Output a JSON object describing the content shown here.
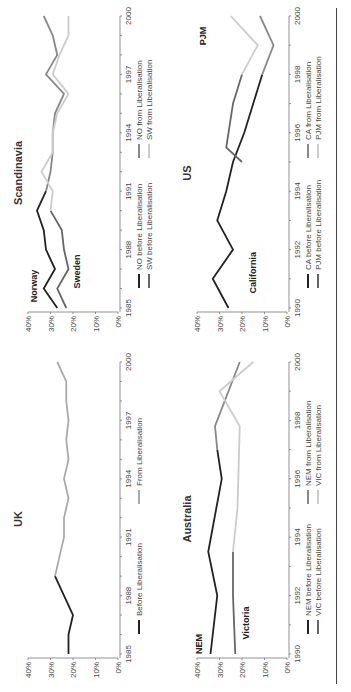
{
  "chart_data": [
    {
      "type": "line",
      "title": "UK",
      "x": [
        1985,
        1986,
        1987,
        1988,
        1989,
        1990,
        1991,
        1992,
        1993,
        1994,
        1995,
        1996,
        1997,
        1998,
        1999,
        2000
      ],
      "xticks": [
        "1985",
        "1988",
        "1991",
        "1994",
        "1997",
        "2000"
      ],
      "yticks": [
        "0%",
        "10%",
        "20%",
        "30%",
        "40%"
      ],
      "ylim": [
        0,
        40
      ],
      "series": [
        {
          "name": "Before Liberalisation",
          "color": "#222222",
          "x": [
            1985,
            1986,
            1987,
            1988,
            1989
          ],
          "values": [
            22,
            22,
            20,
            24,
            28
          ]
        },
        {
          "name": "From Liberalisation",
          "color": "#aaaaaa",
          "x": [
            1989,
            1990,
            1991,
            1992,
            1993,
            1994,
            1995,
            1996,
            1997,
            1998,
            1999,
            2000
          ],
          "values": [
            28,
            26,
            24,
            24,
            22,
            24,
            22,
            23,
            22,
            23,
            23,
            27
          ]
        }
      ],
      "legend": [
        "Before Liberalisation",
        "From Liberalisation"
      ]
    },
    {
      "type": "line",
      "title": "Scandinavia",
      "xticks": [
        "1985",
        "1988",
        "1991",
        "1994",
        "1997",
        "2000"
      ],
      "yticks": [
        "0%",
        "10%",
        "20%",
        "30%",
        "40%"
      ],
      "ylim": [
        0,
        40
      ],
      "annotations": [
        "Norway",
        "Sweden"
      ],
      "series": [
        {
          "name": "NO before Liberalisation",
          "color": "#222222",
          "x": [
            1985,
            1986,
            1987,
            1988,
            1989,
            1990,
            1991
          ],
          "values": [
            27,
            33,
            28,
            32,
            33,
            36,
            32
          ]
        },
        {
          "name": "SW before Liberalisation",
          "color": "#666666",
          "x": [
            1985,
            1986,
            1987,
            1988,
            1989,
            1990
          ],
          "values": [
            23,
            27,
            22,
            24,
            25,
            30
          ]
        },
        {
          "name": "NO from Liberalisation",
          "color": "#888888",
          "x": [
            1991,
            1992,
            1993,
            1994,
            1995,
            1996,
            1997,
            1998,
            1999,
            2000
          ],
          "values": [
            32,
            30,
            29,
            29,
            28,
            24,
            32,
            27,
            29,
            33
          ]
        },
        {
          "name": "SW from Liberalisation",
          "color": "#cccccc",
          "x": [
            1990,
            1991,
            1992,
            1993,
            1994,
            1995,
            1996,
            1997,
            1998,
            1999,
            2000
          ],
          "values": [
            30,
            29,
            34,
            29,
            29,
            27,
            22,
            29,
            26,
            22,
            22
          ]
        }
      ],
      "legend": [
        "NO before Liberalisation",
        "NO from Liberalisation",
        "SW before Liberalisation",
        "SW from Liberalisation"
      ]
    },
    {
      "type": "line",
      "title": "Australia",
      "xticks": [
        "1990",
        "1992",
        "1994",
        "1996",
        "1998",
        "2000"
      ],
      "yticks": [
        "0%",
        "10%",
        "20%",
        "30%",
        "40%"
      ],
      "ylim": [
        0,
        40
      ],
      "annotations": [
        "NEM",
        "Victoria"
      ],
      "series": [
        {
          "name": "NEM before Liberalisation",
          "color": "#222222",
          "x": [
            1990,
            1992,
            1993.5,
            1996,
            1997
          ],
          "values": [
            34,
            31,
            35,
            29,
            31
          ]
        },
        {
          "name": "VIC before Liberalisation",
          "color": "#666666",
          "x": [
            1990,
            1992,
            1993.5
          ],
          "values": [
            23,
            24,
            24
          ]
        },
        {
          "name": "NEM from Liberalisation",
          "color": "#888888",
          "x": [
            1997,
            1997.8,
            2000
          ],
          "values": [
            31,
            32,
            21
          ]
        },
        {
          "name": "VIC from Liberalisation",
          "color": "#cccccc",
          "x": [
            1993.5,
            1995,
            1997.8,
            1999,
            2000
          ],
          "values": [
            24,
            22,
            21,
            30,
            15
          ]
        }
      ],
      "legend": [
        "NEM before Liberalisation",
        "NEM from Liberalisation",
        "VIC before Liberalisation",
        "VIC from Liberalisation"
      ]
    },
    {
      "type": "line",
      "title": "US",
      "xticks": [
        "1990",
        "1992",
        "1994",
        "1996",
        "1998",
        "2000"
      ],
      "yticks": [
        "0%",
        "10%",
        "20%",
        "30%",
        "40%"
      ],
      "ylim": [
        0,
        40
      ],
      "annotations": [
        "California",
        "PJM"
      ],
      "series": [
        {
          "name": "CA before Liberalisation",
          "color": "#222222",
          "x": [
            1990,
            1991,
            1992,
            1993,
            1994,
            1995,
            1996,
            1997,
            1998
          ],
          "values": [
            26,
            33,
            24,
            31,
            27,
            24,
            19,
            15,
            11
          ]
        },
        {
          "name": "PJM before Liberalisation",
          "color": "#666666",
          "x": [
            1995,
            1995.5,
            1997,
            1998
          ],
          "values": [
            20,
            27,
            24,
            20
          ]
        },
        {
          "name": "CA from Liberalisation",
          "color": "#888888",
          "x": [
            1998,
            1999,
            2000
          ],
          "values": [
            11,
            6,
            12
          ]
        },
        {
          "name": "PJM from Liberalisation",
          "color": "#cccccc",
          "x": [
            1998,
            1999,
            2000
          ],
          "values": [
            20,
            13,
            25
          ]
        }
      ],
      "legend": [
        "CA before Liberalisation",
        "CA from Liberalisation",
        "PJM before Liberalisation",
        "PJM from Liberalisation"
      ]
    }
  ]
}
